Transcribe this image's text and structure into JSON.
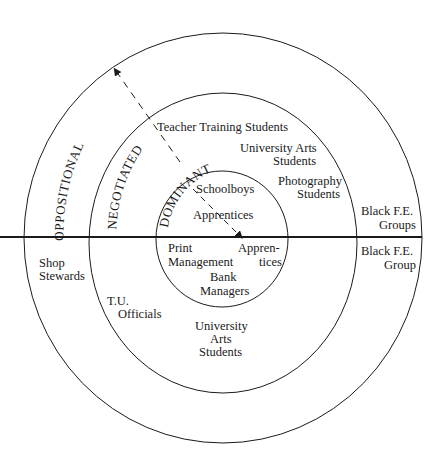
{
  "diagram": {
    "rings": [
      {
        "name": "DOMINANT",
        "label": "DOMINANT"
      },
      {
        "name": "NEGOTIATED",
        "label": "NEGOTIATED"
      },
      {
        "name": "OPPOSITIONAL",
        "label": "OPPOSITIONAL"
      }
    ],
    "upper_half": {
      "inner": [
        "Schoolboys",
        "Apprentices"
      ],
      "middle": {
        "teacher_training": "Teacher Training Students",
        "university_arts": [
          "University Arts",
          "Students"
        ],
        "photography": [
          "Photography",
          "Students"
        ]
      },
      "outer": [
        "Black F.E.",
        "Groups"
      ]
    },
    "lower_half": {
      "inner": {
        "print_management": [
          "Print",
          "Management"
        ],
        "apprentices": [
          "Appren-",
          "tices"
        ],
        "bank_managers": [
          "Bank",
          "Managers"
        ]
      },
      "middle": {
        "tu_officials": [
          "T.U.",
          "Officials"
        ],
        "university_arts": [
          "University",
          "Arts",
          "Students"
        ]
      },
      "outer": {
        "shop_stewards": [
          "Shop",
          "Stewards"
        ],
        "black_fe_group": [
          "Black F.E.",
          "Group"
        ]
      }
    },
    "arrow": {
      "from": "DOMINANT",
      "to": "OPPOSITIONAL",
      "style": "dashed"
    },
    "colors": {
      "line": "#1a1a1a",
      "background": "#ffffff"
    }
  }
}
